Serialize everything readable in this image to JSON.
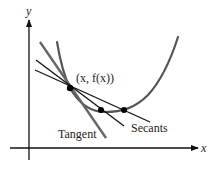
{
  "figure": {
    "axes": {
      "x_label": "x",
      "y_label": "y"
    },
    "point_label": "(x, f(x))",
    "tangent_label": "Tangent",
    "secants_label": "Secants",
    "colors": {
      "axis": "#111111",
      "curve": "#555555",
      "tangent": "#666666",
      "secant": "#111111",
      "point": "#000000",
      "background": "#ffffff"
    }
  }
}
